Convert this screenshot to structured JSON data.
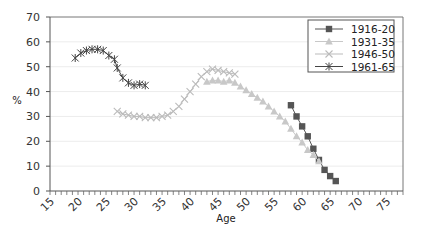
{
  "chart_data": {
    "type": "line",
    "title": "",
    "xlabel": "Age",
    "ylabel": "%",
    "xlim": [
      15,
      78
    ],
    "ylim": [
      0,
      70
    ],
    "x_ticks": [
      15,
      20,
      25,
      30,
      35,
      40,
      45,
      50,
      55,
      60,
      65,
      70,
      75
    ],
    "y_ticks": [
      0,
      10,
      20,
      30,
      40,
      50,
      60,
      70
    ],
    "grid": "horizontal",
    "legend_position": "top-right",
    "series": [
      {
        "name": "1916-20",
        "marker": "square",
        "color": "#555555",
        "x": [
          58,
          59,
          60,
          61,
          62,
          63,
          64,
          65,
          66
        ],
        "y": [
          34.5,
          30,
          26,
          22,
          17,
          12.5,
          8.5,
          6,
          4
        ]
      },
      {
        "name": "1931-35",
        "marker": "triangle",
        "color": "#c8c8c8",
        "x": [
          43,
          44,
          45,
          46,
          47,
          48,
          49,
          50,
          51,
          52,
          53,
          54,
          55,
          56,
          57,
          58,
          59,
          60,
          61,
          62,
          63
        ],
        "y": [
          44,
          44.5,
          44.5,
          44,
          44.5,
          43.5,
          42,
          40.5,
          39,
          37.5,
          36,
          34,
          32,
          30,
          28,
          25,
          22,
          19.5,
          16.5,
          14.5,
          12
        ]
      },
      {
        "name": "1946-50",
        "marker": "x",
        "color": "#bbbbbb",
        "x": [
          27,
          28,
          29,
          30,
          31,
          32,
          33,
          34,
          35,
          36,
          37,
          38,
          39,
          40,
          41,
          42,
          43,
          44,
          45,
          46,
          47,
          48
        ],
        "y": [
          32,
          31,
          30.5,
          30,
          30,
          29.5,
          29.5,
          29.5,
          30,
          30.5,
          32,
          34,
          37,
          40,
          43,
          46,
          48,
          49,
          48.5,
          48,
          47.5,
          47
        ]
      },
      {
        "name": "1961-65",
        "marker": "star",
        "color": "#444444",
        "x": [
          19.5,
          20.5,
          21.5,
          22.5,
          23.5,
          24.5,
          25.5,
          26.5,
          27,
          28,
          29,
          30,
          31,
          32
        ],
        "y": [
          53.5,
          55.5,
          56.5,
          57,
          57,
          56.5,
          54.5,
          53,
          49.5,
          45.5,
          43.5,
          42.5,
          43,
          42.5
        ]
      }
    ]
  },
  "legend": {
    "items": [
      "1916-20",
      "1931-35",
      "1946-50",
      "1961-65"
    ]
  },
  "axes": {
    "x_title": "Age",
    "y_title": "%"
  }
}
